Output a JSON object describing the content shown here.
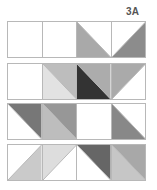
{
  "label": "3A",
  "rows": [
    {
      "cells": [
        {
          "diag": "none",
          "a": "#ffffff",
          "b": "#ffffff"
        },
        {
          "diag": "none",
          "a": "#ffffff",
          "b": "#ffffff"
        },
        {
          "diag": "tlbr",
          "a": "#ffffff",
          "b": "#a9a9a9"
        },
        {
          "diag": "trbl",
          "a": "#ffffff",
          "b": "#8c8c8c"
        }
      ]
    },
    {
      "cells": [
        {
          "diag": "none",
          "a": "#ffffff",
          "b": "#ffffff"
        },
        {
          "diag": "tlbr",
          "a": "#bdbdbd",
          "b": "#e2e2e2"
        },
        {
          "diag": "tlbr",
          "a": "#acacac",
          "b": "#333333"
        },
        {
          "diag": "trbl",
          "a": "#aaaaaa",
          "b": "#ffffff"
        }
      ]
    },
    {
      "cells": [
        {
          "diag": "tlbr",
          "a": "#777777",
          "b": "#ffffff"
        },
        {
          "diag": "tlbr",
          "a": "#979797",
          "b": "#bdbdbd"
        },
        {
          "diag": "none",
          "a": "#ffffff",
          "b": "#ffffff"
        },
        {
          "diag": "tlbr",
          "a": "#ffffff",
          "b": "#888888"
        }
      ]
    },
    {
      "cells": [
        {
          "diag": "trbl",
          "a": "#ffffff",
          "b": "#cacaca"
        },
        {
          "diag": "trbl",
          "a": "#dddddd",
          "b": "#ffffff"
        },
        {
          "diag": "tlbr",
          "a": "#666666",
          "b": "#ffffff"
        },
        {
          "diag": "tlbr",
          "a": "#a8a8a8",
          "b": "#c6c6c6"
        }
      ]
    }
  ],
  "row_tops": [
    21,
    63,
    103,
    144
  ]
}
